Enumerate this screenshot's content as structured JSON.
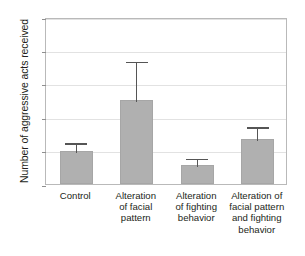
{
  "chart_data": {
    "type": "bar",
    "title": "",
    "xlabel": "",
    "ylabel": "Number of aggressive acts received",
    "ylim": [
      0,
      25
    ],
    "yticks": [
      0,
      5,
      10,
      15,
      20,
      25
    ],
    "grid": true,
    "legend": false,
    "bar_color": "#b0b0b0",
    "error_color": "#555555",
    "categories": [
      "Control",
      "Alteration of facial pattern",
      "Alteration of fighting behavior",
      "Alteration of facial pattern and fighting behavior"
    ],
    "category_lines": [
      [
        "Control"
      ],
      [
        "Alteration",
        "of facial",
        "pattern"
      ],
      [
        "Alteration",
        "of fighting",
        "behavior"
      ],
      [
        "Alteration of",
        "facial pattern",
        "and fighting",
        "behavior"
      ]
    ],
    "values": [
      4.9,
      12.6,
      2.8,
      6.7
    ],
    "error_upper": [
      6.4,
      18.6,
      4.1,
      8.8
    ],
    "error_bars": "upper-only"
  },
  "axis": {
    "tick_labels": [
      "0",
      "5",
      "10",
      "15",
      "20",
      "25"
    ],
    "y_title": "Number of aggressive acts received"
  }
}
